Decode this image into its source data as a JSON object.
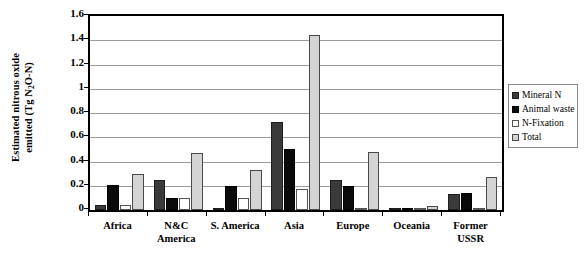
{
  "chart_data": {
    "type": "bar",
    "title": "",
    "xlabel": "",
    "ylabel_line1": "Estimated nitrous oxide",
    "ylabel_line2": "emitted (Tg N2O-N)",
    "ylim": [
      0,
      1.6
    ],
    "ytick_labels": [
      "0",
      "0.2",
      "0.4",
      "0.6",
      "0.8",
      "1",
      "1.2",
      "1.4",
      "1.6"
    ],
    "ytick_values": [
      0,
      0.2,
      0.4,
      0.6,
      0.8,
      1,
      1.2,
      1.4,
      1.6
    ],
    "grid": true,
    "legend_position": "right-outside",
    "categories": [
      "Africa",
      "N&C America",
      "S. America",
      "Asia",
      "Europe",
      "Oceania",
      "Former USSR"
    ],
    "category_label_lines": [
      [
        "Africa"
      ],
      [
        "N&C",
        "America"
      ],
      [
        "S. America"
      ],
      [
        "Asia"
      ],
      [
        "Europe"
      ],
      [
        "Oceania"
      ],
      [
        "Former",
        "USSR"
      ]
    ],
    "series": [
      {
        "name": "Mineral N",
        "color": "#3a3a3a",
        "values": [
          0.04,
          0.25,
          0.02,
          0.73,
          0.25,
          0.005,
          0.13
        ]
      },
      {
        "name": "Animal waste",
        "color": "#0a0a0a",
        "values": [
          0.21,
          0.1,
          0.2,
          0.5,
          0.2,
          0.02,
          0.14
        ]
      },
      {
        "name": "N-Fixation",
        "color": "#ffffff",
        "values": [
          0.04,
          0.1,
          0.1,
          0.17,
          0.01,
          0.005,
          0.01
        ]
      },
      {
        "name": "Total",
        "color": "#d4d4d4",
        "values": [
          0.3,
          0.47,
          0.33,
          1.44,
          0.48,
          0.03,
          0.27
        ]
      }
    ]
  }
}
